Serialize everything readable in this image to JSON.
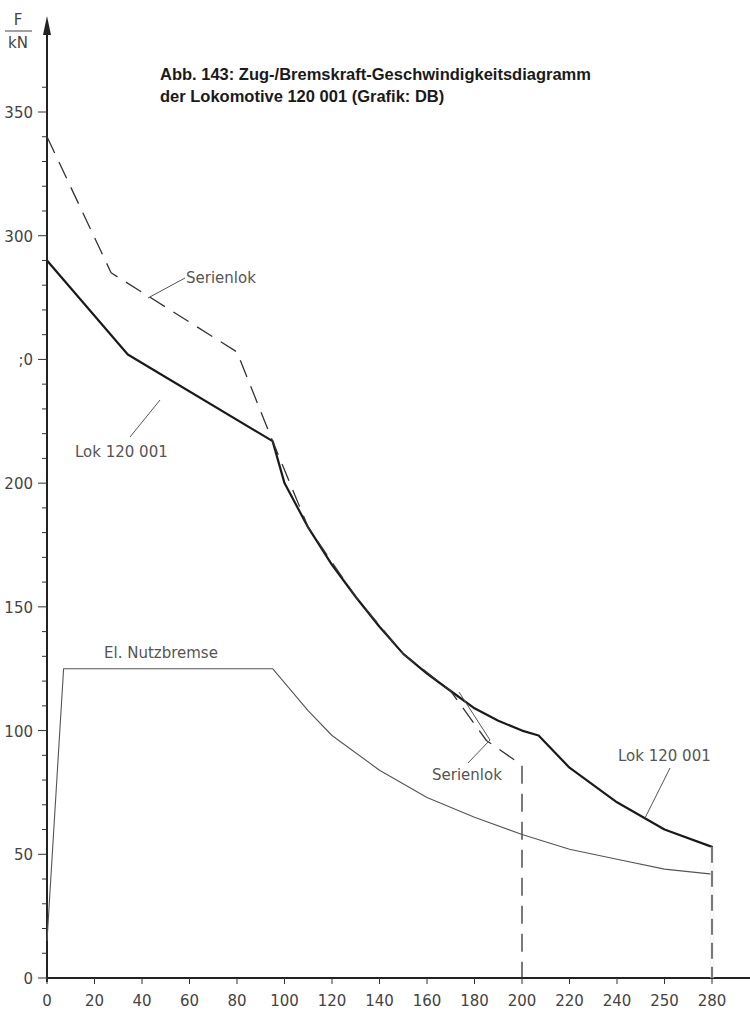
{
  "title": {
    "line1": "Abb. 143: Zug-/Bremskraft-Geschwindigkeitsdiagramm",
    "line2": "der Lokomotive 120 001 (Grafik: DB)"
  },
  "y_axis": {
    "unit_top": "F",
    "unit_bottom": "kN",
    "ticks": [
      "0",
      "50",
      "100",
      "150",
      "200",
      "̂0",
      "300",
      "350"
    ]
  },
  "x_axis": {
    "ticks": [
      "0",
      "20",
      "40",
      "60",
      "80",
      "100",
      "120",
      "140",
      "160",
      "180",
      "200",
      "220",
      "240",
      "250",
      "280"
    ]
  },
  "annotations": {
    "serienlok_top": "Serienlok",
    "lok_top": "Lok 120 001",
    "nutzbremse": "El. Nutzbremse",
    "serienlok_bottom": "Serienlok",
    "lok_bottom": "Lok 120 001"
  },
  "chart_data": {
    "type": "line",
    "title": "Abb. 143: Zug-/Bremskraft-Geschwindigkeitsdiagramm der Lokomotive 120 001 (Grafik: DB)",
    "xlabel": "v (km/h)",
    "ylabel": "F / kN",
    "xlim": [
      0,
      280
    ],
    "ylim": [
      0,
      350
    ],
    "x_ticks": [
      0,
      20,
      40,
      60,
      80,
      100,
      120,
      140,
      160,
      180,
      200,
      220,
      240,
      260,
      280
    ],
    "x_tick_labels": [
      "0",
      "20",
      "40",
      "60",
      "80",
      "100",
      "120",
      "140",
      "160",
      "180",
      "200",
      "220",
      "240",
      "250",
      "280"
    ],
    "y_ticks": [
      0,
      50,
      100,
      150,
      200,
      250,
      300,
      350
    ],
    "grid": false,
    "legend": "inline annotations",
    "series": [
      {
        "name": "Lok 120 001",
        "style": "solid thick",
        "x": [
          0,
          34,
          95,
          100,
          110,
          120,
          130,
          140,
          150,
          160,
          170,
          180,
          190,
          200,
          207,
          220,
          240,
          260,
          280,
          280
        ],
        "y": [
          290,
          252,
          217,
          200,
          182,
          167,
          154,
          142,
          131,
          123,
          116,
          109,
          104,
          100,
          98,
          85,
          71,
          60,
          53,
          0
        ]
      },
      {
        "name": "Serienlok",
        "style": "dashed",
        "x": [
          0,
          27,
          80,
          95,
          110,
          130,
          150,
          170,
          185,
          200,
          200
        ],
        "y": [
          340,
          285,
          253,
          217,
          182,
          154,
          131,
          116,
          96,
          86,
          0
        ]
      },
      {
        "name": "El. Nutzbremse",
        "style": "solid thin",
        "x": [
          0,
          7,
          95,
          110,
          120,
          140,
          160,
          180,
          200,
          220,
          240,
          260,
          280,
          280
        ],
        "y": [
          15,
          125,
          125,
          108,
          98,
          84,
          73,
          65,
          58,
          52,
          48,
          44,
          42,
          0
        ]
      }
    ]
  }
}
